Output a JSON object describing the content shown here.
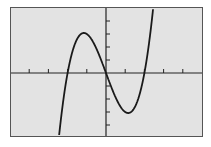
{
  "chart_data": {
    "type": "line",
    "title": "",
    "xlabel": "",
    "ylabel": "",
    "function": "y = x^3 - 4x",
    "xlim": [
      -5,
      5
    ],
    "ylim": [
      -5,
      5
    ],
    "x_ticks": [
      -4,
      -3,
      -2,
      -1,
      1,
      2,
      3,
      4
    ],
    "y_ticks": [
      -4,
      -3,
      -2,
      -1,
      1,
      2,
      3,
      4
    ],
    "grid": false,
    "legend": null,
    "series": [
      {
        "name": "f(x)",
        "x": [
          -2.5,
          -2.0,
          -1.5,
          -1.15,
          -1.0,
          -0.5,
          0.0,
          0.5,
          1.0,
          1.15,
          1.5,
          2.0,
          2.5
        ],
        "values": [
          -5.6,
          0.0,
          2.6,
          3.08,
          3.0,
          1.9,
          0.0,
          -1.9,
          -3.0,
          -3.08,
          -2.6,
          0.0,
          5.6
        ]
      }
    ],
    "annotations": {
      "zeros": [
        -2,
        0,
        2
      ],
      "local_max": [
        -1.15,
        3.08
      ],
      "local_min": [
        1.15,
        -3.08
      ]
    }
  },
  "colors": {
    "screen_bg": "#e3e3e3",
    "curve": "#1a1a1a",
    "axes": "#222222",
    "frame": "#555555"
  }
}
